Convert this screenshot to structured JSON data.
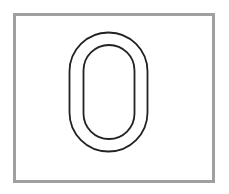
{
  "character": {
    "value": "0",
    "style": "outlined",
    "stroke_color": "#222222",
    "fill_color": "#ffffff"
  },
  "frame": {
    "border_color": "#a0a0a0",
    "background": "#ffffff"
  }
}
